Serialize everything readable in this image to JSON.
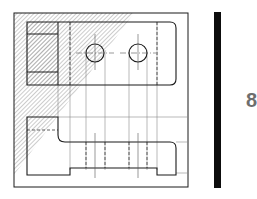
{
  "figure": {
    "type": "orthographic-technical-drawing",
    "views": [
      "top-view",
      "front-view"
    ],
    "holes": 2,
    "hatched_region": "diagonal hatch in upper-left triangular area",
    "colors": {
      "line": "#1a1a1a",
      "thin_line": "#8a8a8a",
      "hatch": "#9a9a9a",
      "bar": "#0d0d0d",
      "page_number": "#6e6e6e"
    }
  },
  "page": {
    "number": "8"
  }
}
